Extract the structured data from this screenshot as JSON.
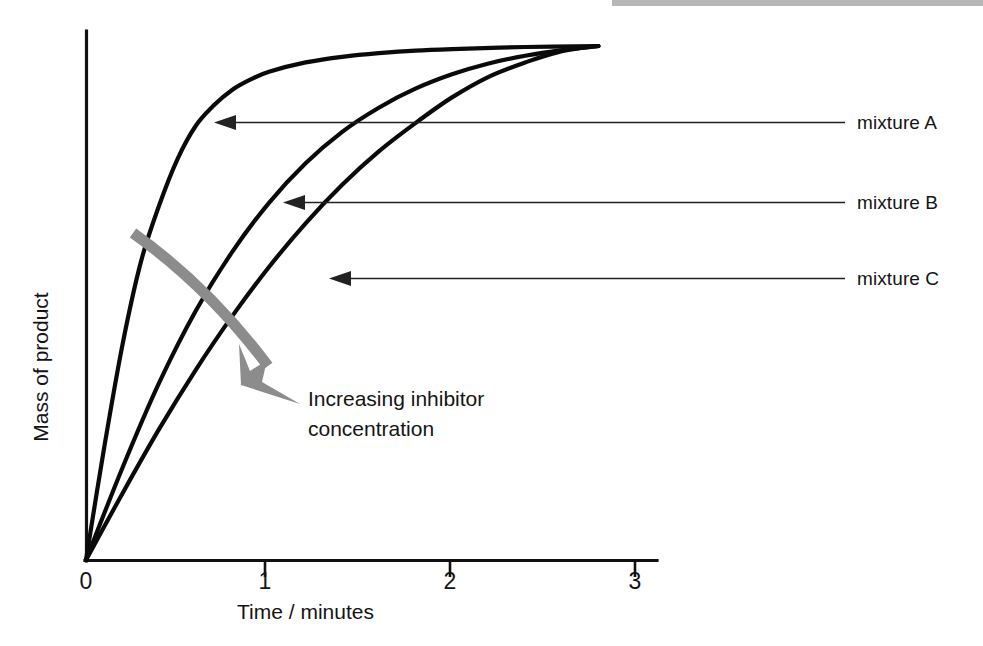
{
  "figure": {
    "name": "rate-of-reaction-with-inhibitor-graph",
    "background": "#ffffff"
  },
  "chart_data": {
    "type": "line",
    "title": "",
    "xlabel": "Time / minutes",
    "ylabel": "Mass of product",
    "xlim": [
      0,
      3.1
    ],
    "ylim": [
      0,
      1.05
    ],
    "xticks": [
      "0",
      "1",
      "2",
      "3"
    ],
    "xtick_values": [
      0,
      1,
      2,
      3
    ],
    "yticks": [],
    "grid": false,
    "legend_position": "right-inline-arrow-labels",
    "axis_color": "#111111",
    "curve_color": "#0a0a0a",
    "annotation_color": "#8c8c8c",
    "series": [
      {
        "name": "mixture A",
        "label": "mixture A",
        "description": "fastest reaction, no inhibitor, plateaus earliest",
        "x": [
          0.0,
          0.1,
          0.2,
          0.3,
          0.4,
          0.5,
          0.6,
          0.7,
          0.8,
          0.9,
          1.0,
          1.2,
          1.4,
          1.6,
          1.8,
          2.0,
          2.4,
          2.8
        ],
        "y": [
          0.0,
          0.22,
          0.42,
          0.58,
          0.69,
          0.78,
          0.845,
          0.885,
          0.915,
          0.935,
          0.95,
          0.968,
          0.979,
          0.986,
          0.991,
          0.994,
          0.998,
          1.0
        ]
      },
      {
        "name": "mixture B",
        "label": "mixture B",
        "description": "intermediate inhibitor concentration, slower rate, same final mass",
        "x": [
          0.0,
          0.2,
          0.4,
          0.6,
          0.8,
          1.0,
          1.2,
          1.4,
          1.6,
          1.8,
          2.0,
          2.2,
          2.4,
          2.6,
          2.8
        ],
        "y": [
          0.0,
          0.18,
          0.345,
          0.485,
          0.6,
          0.695,
          0.772,
          0.833,
          0.88,
          0.917,
          0.945,
          0.966,
          0.981,
          0.992,
          1.0
        ]
      },
      {
        "name": "mixture C",
        "label": "mixture C",
        "description": "highest inhibitor concentration, slowest rate, same final mass",
        "x": [
          0.0,
          0.2,
          0.4,
          0.6,
          0.8,
          1.0,
          1.2,
          1.4,
          1.6,
          1.8,
          2.0,
          2.2,
          2.4,
          2.6,
          2.8
        ],
        "y": [
          0.0,
          0.13,
          0.255,
          0.37,
          0.475,
          0.57,
          0.655,
          0.73,
          0.795,
          0.85,
          0.9,
          0.94,
          0.968,
          0.99,
          1.0
        ]
      }
    ],
    "annotations": [
      {
        "name": "increasing-inhibitor-arrow",
        "text_lines": [
          "Increasing inhibitor",
          "concentration"
        ],
        "text": "Increasing inhibitor concentration",
        "color": "#8c8c8c",
        "direction": "curved-arrow-down-right"
      },
      {
        "name": "leader-mixture-a",
        "points_to_series": "mixture A"
      },
      {
        "name": "leader-mixture-b",
        "points_to_series": "mixture B"
      },
      {
        "name": "leader-mixture-c",
        "points_to_series": "mixture C"
      }
    ]
  },
  "labels": {
    "x_axis_title": "Time / minutes",
    "y_axis_title": "Mass of product",
    "tick_0": "0",
    "tick_1": "1",
    "tick_2": "2",
    "tick_3": "3",
    "series_a": "mixture A",
    "series_b": "mixture B",
    "series_c": "mixture C",
    "annotation_line_1": "Increasing inhibitor",
    "annotation_line_2": "concentration"
  }
}
